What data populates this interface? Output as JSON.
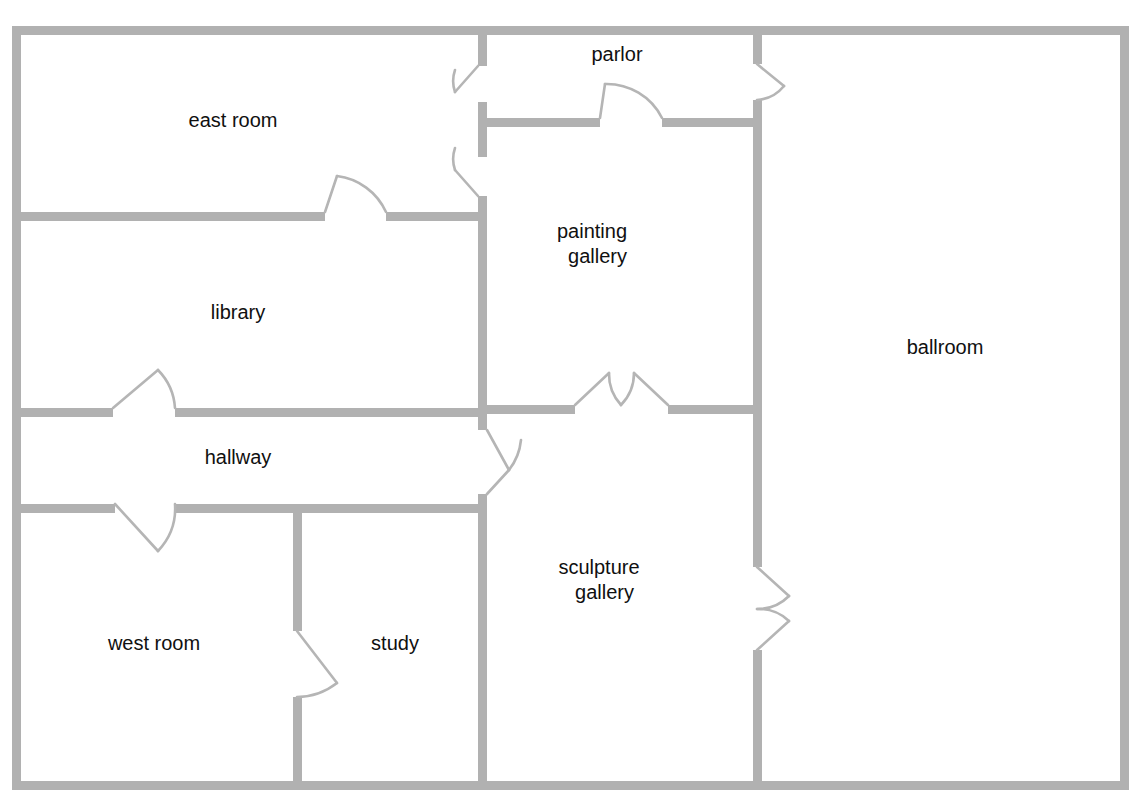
{
  "plan": {
    "title": "museum floor plan",
    "wall_color": "#b1b1b1",
    "door_arc_color": "#b5b5b5",
    "background_color": "#ffffff",
    "label_color": "#101010",
    "wall_thickness": 9
  },
  "rooms": [
    {
      "id": "east-room",
      "label": "east room",
      "label_line1": "east room",
      "label_line2": "",
      "cx": 233,
      "cy": 122
    },
    {
      "id": "parlor",
      "label": "parlor",
      "label_line1": "parlor",
      "label_line2": "",
      "cx": 617,
      "cy": 56
    },
    {
      "id": "library",
      "label": "library",
      "label_line1": "library",
      "label_line2": "",
      "cx": 238,
      "cy": 314
    },
    {
      "id": "painting-gallery",
      "label": "painting gallery",
      "label_line1": "painting",
      "label_line2": "gallery",
      "cx": 617,
      "cy": 245
    },
    {
      "id": "ballroom",
      "label": "ballroom",
      "label_line1": "ballroom",
      "label_line2": "",
      "cx": 945,
      "cy": 349
    },
    {
      "id": "hallway",
      "label": "hallway",
      "label_line1": "hallway",
      "label_line2": "",
      "cx": 238,
      "cy": 459
    },
    {
      "id": "sculpture-gallery",
      "label": "sculpture gallery",
      "label_line1": "sculpture",
      "label_line2": "gallery",
      "cx": 624,
      "cy": 581
    },
    {
      "id": "west-room",
      "label": "west room",
      "label_line1": "west room",
      "label_line2": "",
      "cx": 154,
      "cy": 645
    },
    {
      "id": "study",
      "label": "study",
      "label_line1": "study",
      "label_line2": "",
      "cx": 395,
      "cy": 645
    }
  ],
  "doors": [
    {
      "id": "door-east-room-parlor",
      "between": [
        "east room",
        "parlor"
      ]
    },
    {
      "id": "door-east-room-painting-gallery",
      "between": [
        "east room",
        "painting gallery"
      ]
    },
    {
      "id": "door-east-room-library",
      "between": [
        "east room",
        "library"
      ]
    },
    {
      "id": "door-parlor-ballroom",
      "between": [
        "parlor",
        "ballroom"
      ]
    },
    {
      "id": "door-parlor-painting-gallery",
      "between": [
        "parlor",
        "painting gallery"
      ]
    },
    {
      "id": "door-library-hallway",
      "between": [
        "library",
        "hallway"
      ]
    },
    {
      "id": "door-hallway-west-room",
      "between": [
        "hallway",
        "west room"
      ]
    },
    {
      "id": "door-hallway-sculpture-gallery",
      "between": [
        "hallway",
        "sculpture gallery"
      ]
    },
    {
      "id": "door-painting-sculpture-gallery",
      "between": [
        "painting gallery",
        "sculpture gallery"
      ]
    },
    {
      "id": "door-sculpture-gallery-ballroom",
      "between": [
        "sculpture gallery",
        "ballroom"
      ]
    },
    {
      "id": "door-west-room-study",
      "between": [
        "west room",
        "study"
      ]
    }
  ]
}
